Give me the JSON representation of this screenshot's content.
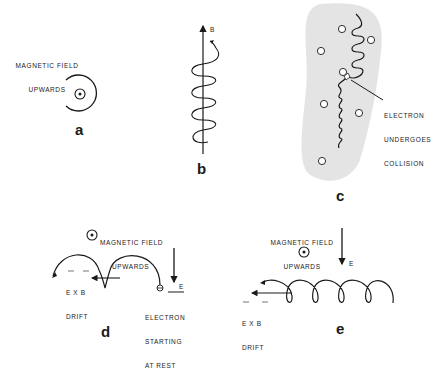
{
  "panels": {
    "a": {
      "letter": "a",
      "field_label_line1": "MAGNETIC FIELD",
      "field_label_line2": "UPWARDS",
      "field_symbol": "dot-in-circle (field out of page)"
    },
    "b": {
      "letter": "b",
      "field_vector_label": "B"
    },
    "c": {
      "letter": "c",
      "annotation_line1": "ELECTRON",
      "annotation_line2": "UNDERGOES",
      "annotation_line3": "COLLISION",
      "neutral_particle_count": 8
    },
    "d": {
      "letter": "d",
      "field_label_line1": "MAGNETIC FIELD",
      "field_label_line2": "UPWARDS",
      "drift_label_line1": "E X B",
      "drift_label_line2": "DRIFT",
      "efield_label": "E",
      "start_label_line1": "ELECTRON",
      "start_label_line2": "STARTING",
      "start_label_line3": "AT REST"
    },
    "e": {
      "letter": "e",
      "field_label_line1": "MAGNETIC FIELD",
      "field_label_line2": "UPWARDS",
      "drift_label_line1": "E X B",
      "drift_label_line2": "DRIFT",
      "efield_label": "E"
    }
  },
  "colors": {
    "ink": "#1a1a1a",
    "plasma_fill": "#e4e4e4",
    "background": "#ffffff"
  }
}
